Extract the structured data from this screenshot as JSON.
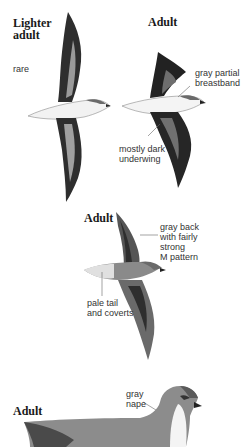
{
  "plate": {
    "figures": [
      {
        "id": "lighter-adult",
        "heading": "Lighter\nadult",
        "heading_line1": "Lighter",
        "heading_line2": "adult",
        "notes": [
          "rare"
        ]
      },
      {
        "id": "adult-underside",
        "heading": "Adult",
        "notes": [
          "gray partial\nbreastband",
          "mostly dark\nunderwing"
        ]
      },
      {
        "id": "adult-upperside",
        "heading": "Adult",
        "notes": [
          "gray back\nwith fairly\nstrong\nM pattern",
          "pale tail\nand coverts"
        ]
      },
      {
        "id": "adult-sitting",
        "heading": "Adult",
        "notes": [
          "gray\nnape"
        ]
      }
    ]
  },
  "colors": {
    "background": "#ffffff",
    "dark_wing": "#2a2a2a",
    "mid_gray": "#7a7a7a",
    "pale_gray": "#d8d8d8",
    "belly_white": "#f4f4f4",
    "text": "#333333"
  }
}
